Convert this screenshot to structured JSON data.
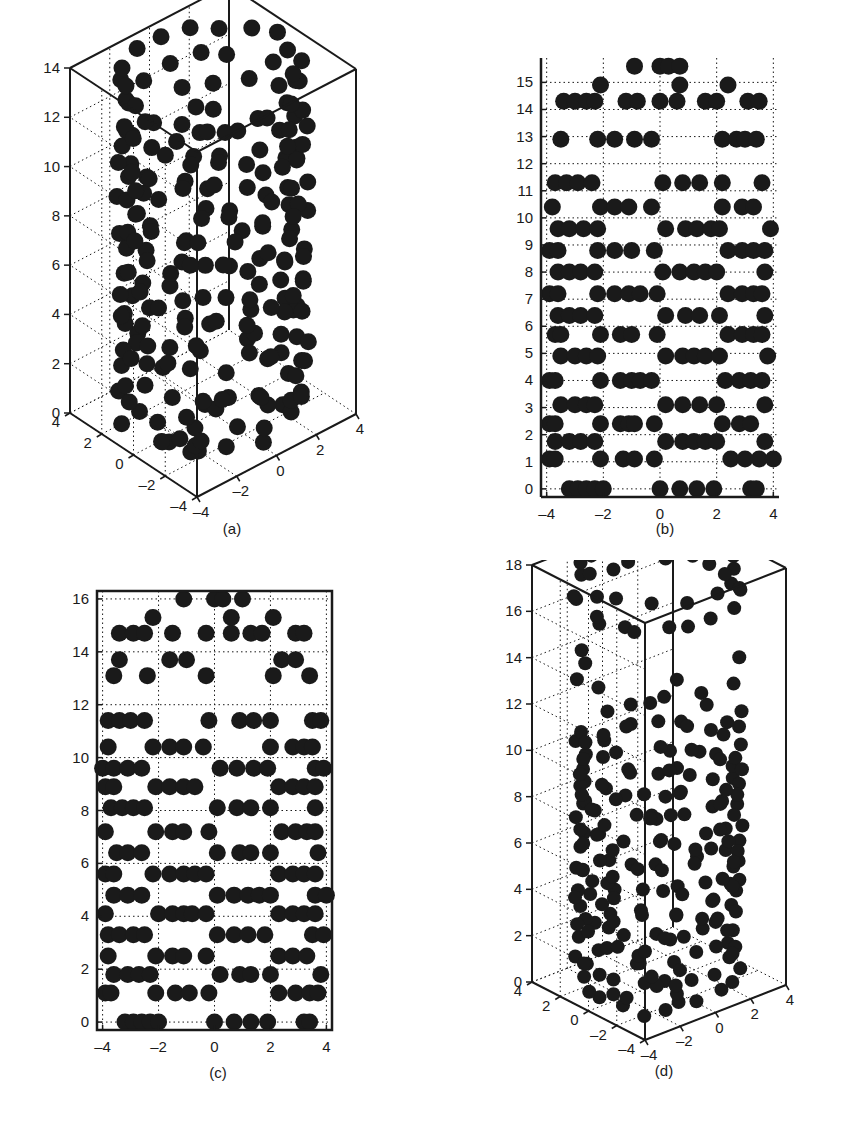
{
  "figure": {
    "captions": [
      "(a)",
      "(b)",
      "(c)",
      "(d)"
    ]
  },
  "chart_data": [
    {
      "id": "a",
      "type": "scatter3d",
      "title": "",
      "caption": "(a)",
      "xlabel": "",
      "ylabel": "",
      "zlabel": "",
      "xlim": [
        -4,
        4
      ],
      "ylim": [
        -4,
        4
      ],
      "zlim": [
        0,
        14
      ],
      "x_ticks": [
        -4,
        -2,
        0,
        2,
        4
      ],
      "y_ticks": [
        -4,
        -2,
        0,
        2,
        4
      ],
      "z_ticks": [
        0,
        2,
        4,
        6,
        8,
        10,
        12,
        14
      ],
      "grid": true,
      "marker": "filled-circle",
      "marker_color": "#1a1a1a",
      "description": "3D box plot of dense spherical markers packed in a cylindrical shell (radius ~3.5) from z=0 to z~14, with a few points on the floor",
      "points_note": "Illustrative only: points are generated procedurally to mimic the look of the markers, not read from the image."
    },
    {
      "id": "b",
      "type": "scatter",
      "title": "",
      "caption": "(b)",
      "xlabel": "",
      "ylabel": "",
      "xlim": [
        -4.2,
        4.2
      ],
      "ylim": [
        -0.3,
        15.9
      ],
      "x_ticks": [
        -4,
        -2,
        0,
        2,
        4
      ],
      "y_ticks": [
        0,
        1,
        2,
        3,
        4,
        5,
        6,
        7,
        8,
        9,
        10,
        11,
        12,
        13,
        14,
        15
      ],
      "grid": true,
      "frame": "left-bottom",
      "marker": "filled-circle",
      "marker_color": "#1a1a1a",
      "rows": [
        {
          "y": 0,
          "x": [
            -3.2,
            -2.9,
            -2.6,
            -2.3,
            -2.0,
            0.0,
            0.7,
            1.3,
            1.9,
            3.2,
            3.4
          ]
        },
        {
          "y": 1.1,
          "x": [
            -3.9,
            -3.7,
            -2.1,
            -1.3,
            -0.9,
            -0.2,
            2.5,
            3.0,
            3.5,
            4.0
          ]
        },
        {
          "y": 1.75,
          "x": [
            -3.7,
            -3.2,
            -2.8,
            -2.3,
            0.2,
            0.8,
            1.2,
            1.6,
            2.0,
            3.7
          ]
        },
        {
          "y": 2.4,
          "x": [
            -3.9,
            -3.7,
            -2.1,
            -1.4,
            -1.1,
            -0.9,
            -0.2,
            2.2,
            2.8,
            3.2
          ]
        },
        {
          "y": 3.1,
          "x": [
            -3.5,
            -3.0,
            -2.6,
            -2.3,
            0.2,
            0.8,
            1.4,
            2.0,
            3.7
          ]
        },
        {
          "y": 4.0,
          "x": [
            -3.9,
            -3.7,
            -2.1,
            -1.4,
            -1.0,
            -0.7,
            -0.3,
            2.3,
            2.8,
            3.2,
            3.6
          ]
        },
        {
          "y": 4.9,
          "x": [
            -3.5,
            -3.0,
            -2.6,
            -2.2,
            0.2,
            0.8,
            1.2,
            1.6,
            2.1,
            3.8
          ]
        },
        {
          "y": 5.7,
          "x": [
            -3.7,
            -3.5,
            -2.1,
            -1.4,
            -1.0,
            -0.1,
            2.4,
            2.9,
            3.3,
            3.6
          ]
        },
        {
          "y": 6.4,
          "x": [
            -3.6,
            -3.2,
            -2.8,
            -2.3,
            0.2,
            0.9,
            1.4,
            2.1,
            3.7
          ]
        },
        {
          "y": 7.2,
          "x": [
            -3.9,
            -3.6,
            -2.2,
            -1.6,
            -1.1,
            -0.7,
            -0.1,
            2.4,
            2.9,
            3.3,
            3.6
          ]
        },
        {
          "y": 8.0,
          "x": [
            -3.6,
            -3.2,
            -2.8,
            -2.3,
            0.1,
            0.7,
            1.2,
            1.6,
            2.0,
            3.7
          ]
        },
        {
          "y": 8.8,
          "x": [
            -3.9,
            -3.6,
            -2.2,
            -1.6,
            -1.0,
            -0.2,
            2.4,
            2.9,
            3.3,
            3.7
          ]
        },
        {
          "y": 9.6,
          "x": [
            -3.6,
            -3.2,
            -2.7,
            -2.2,
            0.2,
            0.9,
            1.3,
            1.8,
            2.1,
            3.9
          ]
        },
        {
          "y": 10.4,
          "x": [
            -3.8,
            -2.1,
            -1.6,
            -1.1,
            -0.3,
            2.2,
            2.9,
            3.3
          ]
        },
        {
          "y": 11.3,
          "x": [
            -3.7,
            -3.3,
            -2.9,
            -2.4,
            0.1,
            0.8,
            1.4,
            2.2,
            3.6
          ]
        },
        {
          "y": 12.9,
          "x": [
            -3.5,
            -2.2,
            -1.6,
            -0.9,
            -0.3,
            2.2,
            2.7,
            3.0,
            3.4
          ]
        },
        {
          "y": 14.3,
          "x": [
            -3.4,
            -3.0,
            -2.6,
            -2.3,
            -1.2,
            -0.8,
            0.0,
            0.6,
            1.6,
            2.0,
            3.1,
            3.5
          ]
        },
        {
          "y": 14.9,
          "x": [
            -2.1,
            0.7,
            2.4
          ]
        },
        {
          "y": 15.6,
          "x": [
            -0.9,
            0.0,
            0.3,
            0.7
          ]
        }
      ],
      "points_note": "Approximate reconstruction from the dot layout, not exact per-marker reads."
    },
    {
      "id": "c",
      "type": "scatter",
      "title": "",
      "caption": "(c)",
      "xlabel": "",
      "ylabel": "",
      "xlim": [
        -4.2,
        4.2
      ],
      "ylim": [
        -0.3,
        16.3
      ],
      "x_ticks": [
        -4,
        -2,
        0,
        2,
        4
      ],
      "y_ticks": [
        0,
        2,
        4,
        6,
        8,
        10,
        12,
        14,
        16
      ],
      "grid": true,
      "frame": "box",
      "marker": "filled-circle",
      "marker_color": "#1a1a1a",
      "rows": [
        {
          "y": 0,
          "x": [
            -3.2,
            -2.9,
            -2.6,
            -2.3,
            -2.0,
            0.0,
            0.7,
            1.3,
            1.9,
            3.2,
            3.4
          ]
        },
        {
          "y": 1.1,
          "x": [
            -3.9,
            -3.7,
            -2.1,
            -1.4,
            -0.9,
            -0.2,
            2.3,
            2.9,
            3.4,
            3.7
          ]
        },
        {
          "y": 1.8,
          "x": [
            -3.6,
            -3.1,
            -2.7,
            -2.3,
            0.2,
            0.9,
            1.3,
            2.0,
            3.8
          ]
        },
        {
          "y": 2.5,
          "x": [
            -3.8,
            -2.1,
            -1.5,
            -1.1,
            -0.3,
            2.3,
            2.8,
            3.3
          ]
        },
        {
          "y": 3.3,
          "x": [
            -3.8,
            -3.4,
            -2.9,
            -2.5,
            0.1,
            0.7,
            1.2,
            1.8,
            3.5,
            3.9
          ]
        },
        {
          "y": 4.1,
          "x": [
            -3.9,
            -2.0,
            -1.5,
            -1.1,
            -0.8,
            -0.3,
            2.3,
            2.8,
            3.2,
            3.6
          ]
        },
        {
          "y": 4.8,
          "x": [
            -3.6,
            -3.1,
            -2.6,
            0.1,
            0.7,
            1.2,
            1.6,
            2.0,
            3.6,
            4.0
          ]
        },
        {
          "y": 5.6,
          "x": [
            -3.9,
            -3.6,
            -2.2,
            -1.6,
            -1.1,
            -0.7,
            -0.3,
            2.3,
            2.8,
            3.2,
            3.6
          ]
        },
        {
          "y": 6.4,
          "x": [
            -3.5,
            -3.1,
            -2.6,
            0.1,
            0.9,
            1.3,
            2.0,
            3.7
          ]
        },
        {
          "y": 7.2,
          "x": [
            -3.9,
            -2.1,
            -1.5,
            -1.1,
            -0.2,
            2.4,
            2.9,
            3.3,
            3.6
          ]
        },
        {
          "y": 8.1,
          "x": [
            -3.7,
            -3.3,
            -2.9,
            -2.5,
            0.1,
            0.8,
            1.3,
            2.0,
            3.6
          ]
        },
        {
          "y": 8.9,
          "x": [
            -3.9,
            -3.6,
            -2.1,
            -1.6,
            -1.1,
            -0.7,
            2.3,
            2.8,
            3.2,
            3.6
          ]
        },
        {
          "y": 9.6,
          "x": [
            -4.0,
            -3.6,
            -3.1,
            -2.6,
            0.2,
            0.8,
            1.4,
            1.9,
            3.6,
            3.9
          ]
        },
        {
          "y": 10.4,
          "x": [
            -3.8,
            -2.2,
            -1.6,
            -1.1,
            -0.4,
            2.0,
            2.8,
            3.2,
            3.5
          ]
        },
        {
          "y": 11.4,
          "x": [
            -3.8,
            -3.4,
            -3.0,
            -2.5,
            -0.2,
            0.9,
            1.4,
            2.0,
            3.5,
            3.8
          ]
        },
        {
          "y": 13.1,
          "x": [
            -3.6,
            -2.4,
            -0.3,
            2.1,
            3.4
          ]
        },
        {
          "y": 13.7,
          "x": [
            -3.4,
            -1.6,
            -1.0,
            2.4,
            2.9
          ]
        },
        {
          "y": 14.7,
          "x": [
            -3.4,
            -2.9,
            -2.5,
            -1.5,
            -0.3,
            0.6,
            1.3,
            1.7,
            2.9,
            3.2
          ]
        },
        {
          "y": 15.3,
          "x": [
            -2.2,
            0.6,
            2.1
          ]
        },
        {
          "y": 16.0,
          "x": [
            -1.1,
            0.0,
            0.3,
            1.0
          ]
        }
      ],
      "points_note": "Approximate reconstruction from the dot layout, not exact per-marker reads."
    },
    {
      "id": "d",
      "type": "scatter3d",
      "title": "",
      "caption": "(d)",
      "xlabel": "",
      "ylabel": "",
      "zlabel": "",
      "xlim": [
        -4,
        4
      ],
      "ylim": [
        -4,
        4
      ],
      "zlim": [
        0,
        18
      ],
      "x_ticks": [
        -4,
        -2,
        0,
        2,
        4
      ],
      "y_ticks": [
        -4,
        -2,
        0,
        2,
        4
      ],
      "z_ticks": [
        0,
        2,
        4,
        6,
        8,
        10,
        12,
        14,
        16,
        18
      ],
      "grid": true,
      "marker": "filled-circle",
      "marker_color": "#1a1a1a",
      "description": "3D box plot of spherical markers in a cylindrical shell from z=0 to z~18; sparser between z=11 and z=16, dense ring near the top",
      "points_note": "Illustrative only: points are generated procedurally to mimic the look of the markers, not read from the image."
    }
  ]
}
